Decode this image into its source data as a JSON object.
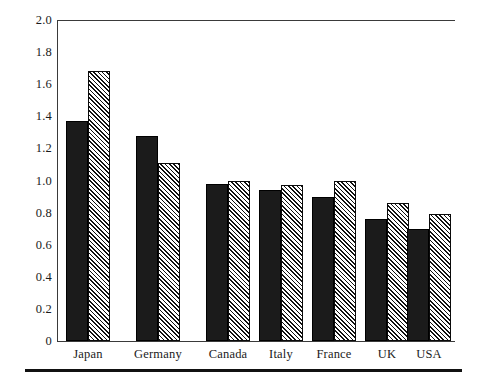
{
  "chart_data": {
    "type": "bar",
    "title": "",
    "subtitle": "",
    "xlabel": "",
    "ylabel": "",
    "ylim": [
      0,
      2.0
    ],
    "grid": false,
    "legend": "none",
    "categories": [
      "Japan",
      "Germany",
      "Canada",
      "Italy",
      "France",
      "UK",
      "USA"
    ],
    "ytick_labels": [
      "2.0",
      "1.8",
      "1.6",
      "1.4",
      "1.2",
      "1.0",
      "0.8",
      "0.6",
      "0.4",
      "0.2",
      "0"
    ],
    "ytick_values": [
      2.0,
      1.8,
      1.6,
      1.4,
      1.2,
      1.0,
      0.8,
      0.6,
      0.4,
      0.2,
      0
    ],
    "series": [
      {
        "name": "series-1-solid",
        "style": "solid-black",
        "values": [
          1.37,
          1.28,
          0.98,
          0.94,
          0.9,
          0.76,
          0.7
        ]
      },
      {
        "name": "series-2-hatched",
        "style": "diagonal-hatch",
        "values": [
          1.68,
          1.11,
          1.0,
          0.97,
          1.0,
          0.86,
          0.79
        ]
      }
    ],
    "colors": {
      "series_1": "#1b1b1b",
      "series_2_fill": "#ffffff",
      "series_2_hatch": "#111111",
      "axis": "#3a3a3a",
      "background": "#ffffff"
    }
  },
  "layout": {
    "group_centers_px": [
      88,
      158,
      228,
      281,
      334,
      387,
      429
    ],
    "plot_left_px": 57,
    "plot_right_px": 455,
    "plot_top_px": 20,
    "plot_baseline_px": 341,
    "bar_width_px": 22
  }
}
